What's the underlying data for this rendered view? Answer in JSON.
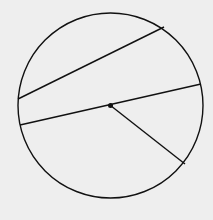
{
  "diagram": {
    "title": "",
    "background": "#eeeeee",
    "stroke": "#111111",
    "circle": {
      "cx": 110.5,
      "cy": 105.5,
      "r": 92.5
    },
    "center_point": {
      "x": 110.5,
      "y": 105.5
    },
    "chord": {
      "x1": 18,
      "y1": 99,
      "x2": 164,
      "y2": 27
    },
    "diameter": {
      "x1": 20,
      "y1": 125,
      "x2": 201,
      "y2": 84
    },
    "radius": {
      "x1": 110.5,
      "y1": 105.5,
      "x2": 185,
      "y2": 164
    }
  }
}
